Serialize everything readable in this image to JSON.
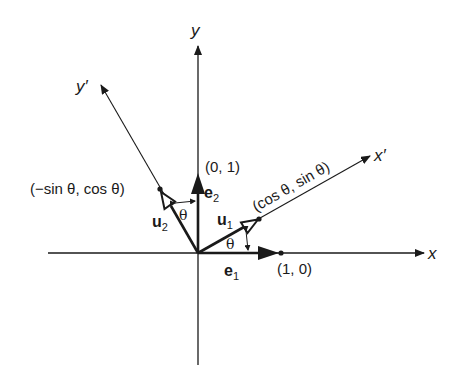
{
  "diagram": {
    "type": "coordinate-rotation",
    "axes": {
      "x": "x",
      "y": "y",
      "x_prime": "x′",
      "y_prime": "y′"
    },
    "vectors": {
      "e1": {
        "base": "e",
        "sub": "1"
      },
      "e2": {
        "base": "e",
        "sub": "2"
      },
      "u1": {
        "base": "u",
        "sub": "1"
      },
      "u2": {
        "base": "u",
        "sub": "2"
      }
    },
    "points": {
      "p10": "(1, 0)",
      "p01": "(0, 1)",
      "pcos": "(cos θ, sin θ)",
      "psin": "(−sin θ, cos θ)"
    },
    "angle_label": "θ",
    "colors": {
      "ink": "#1a1a1a",
      "background": "#ffffff"
    }
  }
}
